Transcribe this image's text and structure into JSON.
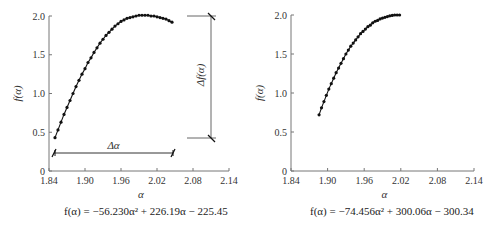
{
  "chart_data": [
    {
      "type": "scatter",
      "title": "",
      "xlabel": "α",
      "ylabel": "f(α)",
      "xlim": [
        1.84,
        2.14
      ],
      "ylim": [
        0,
        2.0
      ],
      "xticks": [
        "1.84",
        "1.90",
        "1.96",
        "2.02",
        "2.08",
        "2.14"
      ],
      "yticks": [
        "0",
        "0.5",
        "1.0",
        "1.5",
        "2.0"
      ],
      "grid": false,
      "annotations": {
        "delta_alpha": "Δα",
        "delta_f": "Δf(α)"
      },
      "equation": "f(α) = −56.230α² + 226.19α − 225.45",
      "series": [
        {
          "name": "fit",
          "x": [
            1.85,
            1.855,
            1.86,
            1.865,
            1.87,
            1.875,
            1.88,
            1.885,
            1.89,
            1.895,
            1.9,
            1.905,
            1.91,
            1.915,
            1.92,
            1.925,
            1.93,
            1.935,
            1.94,
            1.945,
            1.95,
            1.955,
            1.96,
            1.965,
            1.97,
            1.975,
            1.98,
            1.985,
            1.99,
            1.995,
            2.0,
            2.005,
            2.01,
            2.015,
            2.02,
            2.025,
            2.03,
            2.035,
            2.04,
            2.045
          ],
          "y": [
            0.43,
            0.53,
            0.63,
            0.73,
            0.82,
            0.91,
            1.0,
            1.09,
            1.17,
            1.25,
            1.32,
            1.4,
            1.46,
            1.53,
            1.59,
            1.65,
            1.7,
            1.75,
            1.79,
            1.83,
            1.87,
            1.9,
            1.93,
            1.95,
            1.97,
            1.98,
            1.99,
            2.0,
            2.01,
            2.01,
            2.01,
            2.01,
            2.0,
            2.0,
            1.99,
            1.98,
            1.97,
            1.96,
            1.94,
            1.92
          ]
        }
      ]
    },
    {
      "type": "scatter",
      "title": "",
      "xlabel": "α",
      "ylabel": "f(α)",
      "xlim": [
        1.84,
        2.14
      ],
      "ylim": [
        0,
        2.0
      ],
      "xticks": [
        "1.84",
        "1.90",
        "1.96",
        "2.02",
        "2.08",
        "2.14"
      ],
      "yticks": [
        "0",
        "0.5",
        "1.0",
        "1.5",
        "2.0"
      ],
      "grid": false,
      "equation": "f(α) = −74.456α² + 300.06α − 300.34",
      "series": [
        {
          "name": "fit",
          "x": [
            1.886,
            1.89,
            1.894,
            1.898,
            1.902,
            1.906,
            1.91,
            1.914,
            1.918,
            1.922,
            1.926,
            1.93,
            1.934,
            1.938,
            1.942,
            1.946,
            1.95,
            1.954,
            1.958,
            1.962,
            1.966,
            1.97,
            1.974,
            1.978,
            1.982,
            1.986,
            1.99,
            1.994,
            1.998,
            2.002,
            2.006,
            2.01,
            2.014,
            2.018
          ],
          "y": [
            0.72,
            0.81,
            0.89,
            0.97,
            1.05,
            1.12,
            1.19,
            1.26,
            1.32,
            1.38,
            1.44,
            1.5,
            1.55,
            1.6,
            1.64,
            1.68,
            1.72,
            1.76,
            1.79,
            1.82,
            1.85,
            1.87,
            1.9,
            1.92,
            1.93,
            1.95,
            1.96,
            1.97,
            1.98,
            1.99,
            1.995,
            2.0,
            2.0,
            2.0
          ]
        }
      ]
    }
  ],
  "labels": {
    "left_eq": "f(α) = −56.230α² + 226.19α − 225.45",
    "right_eq": "f(α) = −74.456α² + 300.06α − 300.34",
    "delta_alpha": "Δα",
    "delta_f": "Δf(α)",
    "xlabel": "α",
    "ylabel": "f(α)"
  }
}
